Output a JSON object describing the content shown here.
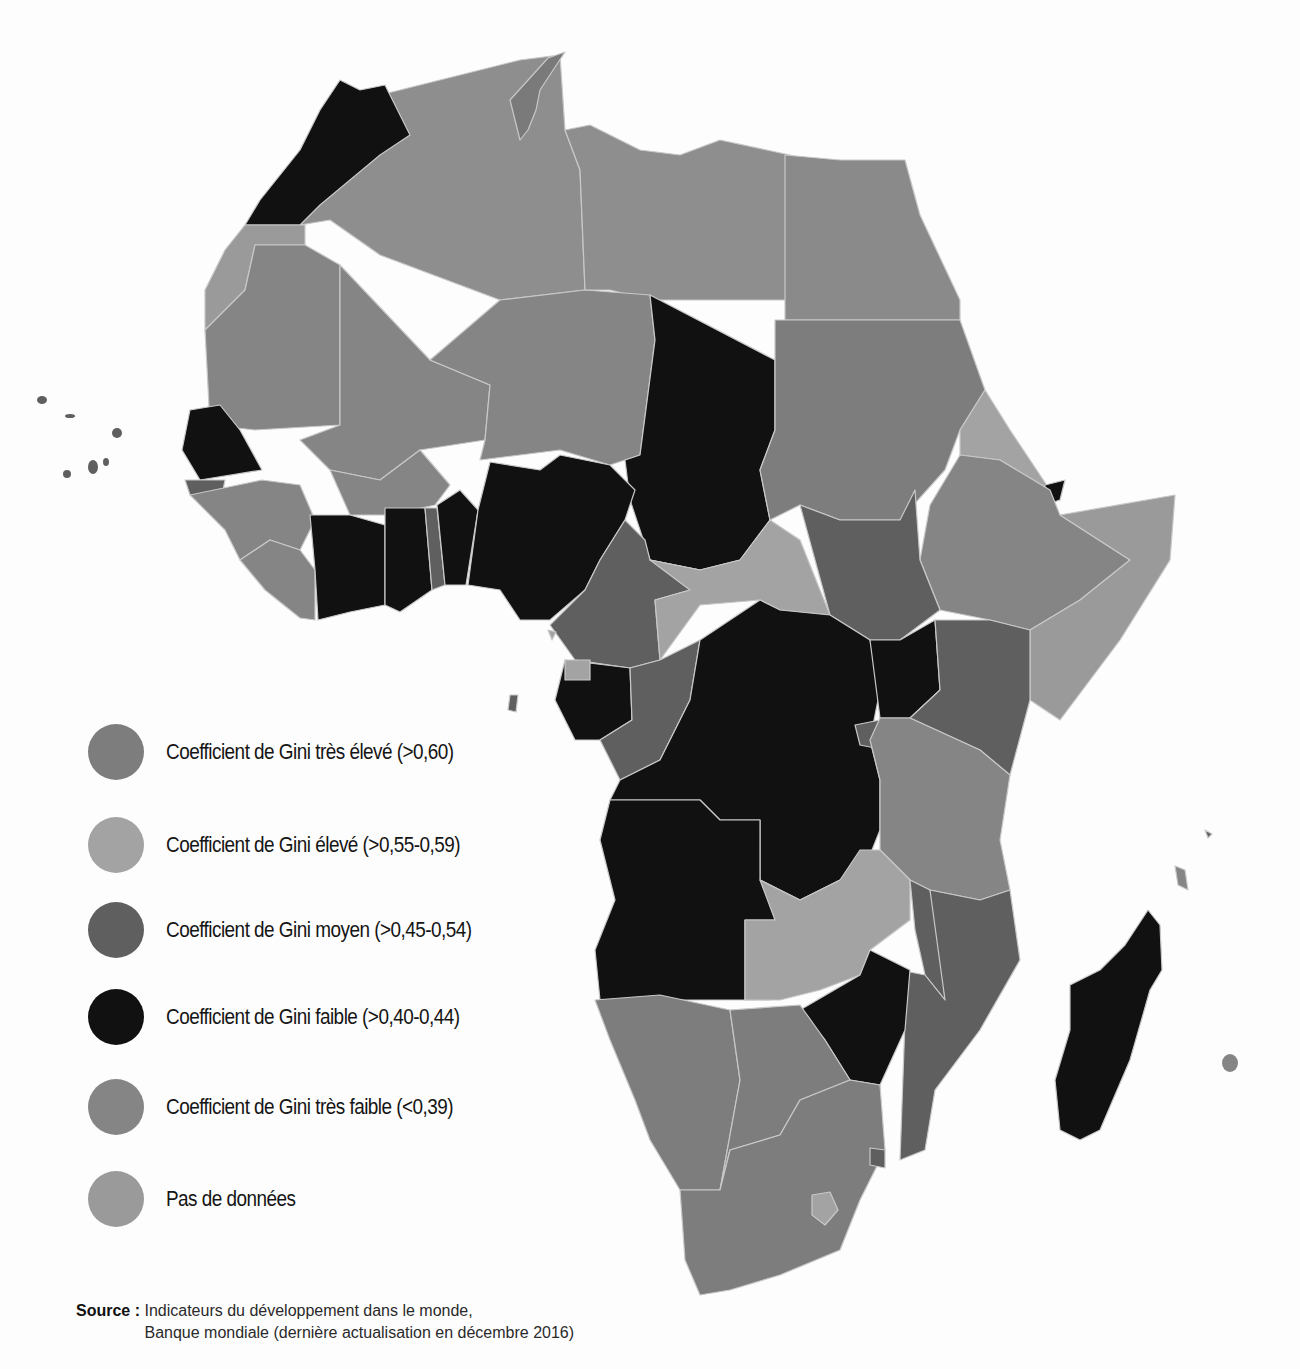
{
  "legend": {
    "items": [
      {
        "label": "Coefficient de Gini très élevé (>0,60)",
        "color": "#7d7d7d"
      },
      {
        "label": "Coefficient de Gini élevé (>0,55-0,59)",
        "color": "#a3a3a3"
      },
      {
        "label": "Coefficient de Gini moyen (>0,45-0,54)",
        "color": "#5f5f5f"
      },
      {
        "label": "Coefficient de Gini faible (>0,40-0,44)",
        "color": "#111111"
      },
      {
        "label": "Coefficient de Gini très faible (<0,39)",
        "color": "#858585"
      },
      {
        "label": "Pas de données",
        "color": "#9a9a9a"
      }
    ]
  },
  "source": {
    "label": "Source :",
    "line1": "Indicateurs du développement dans le monde,",
    "line2": "Banque mondiale (dernière actualisation en décembre 2016)"
  },
  "map": {
    "region": "Afrique",
    "colors": {
      "faible": "#111111",
      "moyen": "#5f5f5f",
      "tres_eleve": "#7d7d7d",
      "tres_faible": "#858585",
      "pas_de_donnees": "#9a9a9a",
      "eleve": "#a3a3a3"
    }
  }
}
